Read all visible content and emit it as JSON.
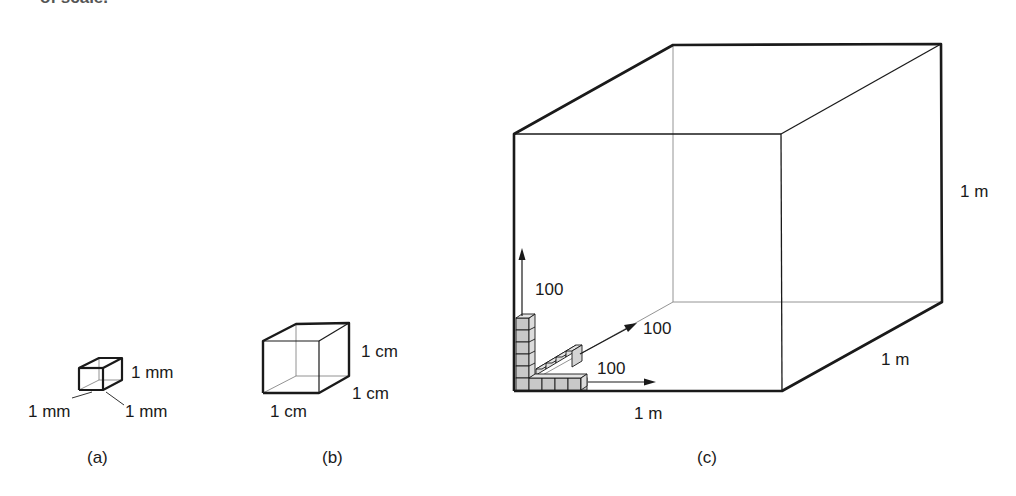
{
  "header": {
    "cut_text": "of scale."
  },
  "figures": [
    {
      "id": "a",
      "caption": "(a)",
      "labels": {
        "height": "1 mm",
        "width": "1 mm",
        "depth": "1 mm"
      }
    },
    {
      "id": "b",
      "caption": "(b)",
      "labels": {
        "height": "1 cm",
        "width": "1 cm",
        "depth": "1 cm"
      }
    },
    {
      "id": "c",
      "caption": "(c)",
      "labels": {
        "height": "1 m",
        "width": "1 m",
        "depth": "1 m"
      },
      "arrows": {
        "vertical": "100",
        "diagonal": "100",
        "horizontal": "100"
      }
    }
  ],
  "colors": {
    "line": "#1a1a1a",
    "thin_line": "#555555",
    "cube_fill": "#c8c8c8"
  }
}
